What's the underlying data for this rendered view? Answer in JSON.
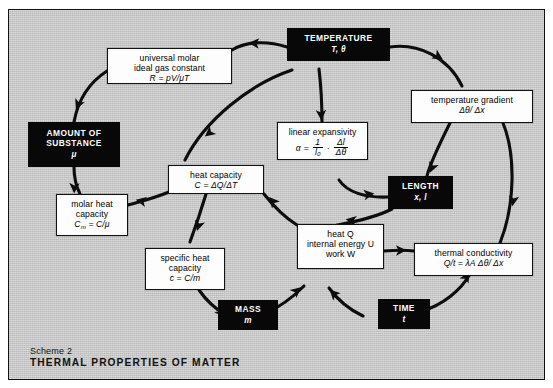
{
  "diagram": {
    "scheme_label": "Scheme 2",
    "title": "THERMAL PROPERTIES OF MATTER",
    "colors": {
      "field": "#c9c9c9",
      "node_black": "#080808",
      "node_white": "#fdfdfd",
      "stroke": "#111111"
    }
  },
  "nodes": {
    "temperature": {
      "title": "TEMPERATURE",
      "symbols": "T, θ"
    },
    "amount_of_substance": {
      "title": "AMOUNT OF SUBSTANCE",
      "line1": "AMOUNT OF",
      "line2": "SUBSTANCE",
      "symbols": "μ"
    },
    "length": {
      "title": "LENGTH",
      "symbols": "x, l"
    },
    "mass": {
      "title": "MASS",
      "symbols": "m"
    },
    "time": {
      "title": "TIME",
      "symbols": "t"
    },
    "gas_constant": {
      "line1": "universal molar",
      "line2": "ideal gas constant",
      "formula": "R = pV/μT"
    },
    "temperature_gradient": {
      "line1": "temperature gradient",
      "formula": "Δθ/ Δx"
    },
    "linear_expansivity": {
      "line1": "linear expansivity",
      "alpha": "α",
      "equals": "=",
      "frac1_num": "1",
      "frac1_den": "l₀",
      "dot": "·",
      "frac2_num": "Δl",
      "frac2_den": "Δθ"
    },
    "heat_capacity": {
      "line1": "heat capacity",
      "formula": "C = ΔQ/ΔT"
    },
    "molar_heat_capacity": {
      "line1": "molar heat",
      "line2": "capacity",
      "formula_lhs": "C",
      "formula_sub": "m",
      "formula_rhs": "= C/μ"
    },
    "specific_heat_capacity": {
      "line1": "specific heat",
      "line2": "capacity",
      "formula": "c = C/m"
    },
    "energy": {
      "line1": "heat Q",
      "line2": "internal energy U",
      "line3": "work W"
    },
    "thermal_conductivity": {
      "line1": "thermal conductivity",
      "formula": "Q/t = λA Δθ/ Δx"
    }
  },
  "edges": [
    {
      "from": "temperature",
      "to": "gas_constant"
    },
    {
      "from": "gas_constant",
      "to": "amount_of_substance"
    },
    {
      "from": "amount_of_substance",
      "to": "molar_heat_capacity"
    },
    {
      "from": "heat_capacity",
      "to": "molar_heat_capacity"
    },
    {
      "from": "temperature",
      "to": "heat_capacity"
    },
    {
      "from": "heat_capacity",
      "to": "specific_heat_capacity"
    },
    {
      "from": "specific_heat_capacity",
      "to": "mass"
    },
    {
      "from": "mass",
      "to": "energy"
    },
    {
      "from": "temperature",
      "to": "linear_expansivity"
    },
    {
      "from": "linear_expansivity",
      "to": "length"
    },
    {
      "from": "temperature",
      "to": "temperature_gradient"
    },
    {
      "from": "temperature_gradient",
      "to": "length"
    },
    {
      "from": "temperature_gradient",
      "to": "thermal_conductivity"
    },
    {
      "from": "length",
      "to": "energy"
    },
    {
      "from": "energy",
      "to": "heat_capacity"
    },
    {
      "from": "energy",
      "to": "thermal_conductivity"
    },
    {
      "from": "time",
      "to": "energy"
    },
    {
      "from": "time",
      "to": "thermal_conductivity"
    }
  ]
}
